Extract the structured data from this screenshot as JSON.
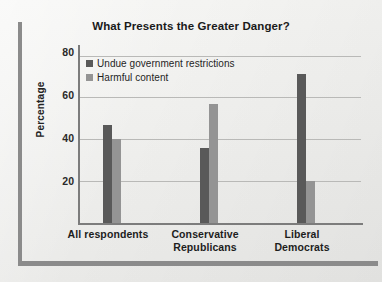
{
  "chart_data": {
    "type": "bar",
    "title": "What Presents the Greater Danger?",
    "xlabel": "",
    "ylabel": "Percentage",
    "categories": [
      "All respondents",
      "Conservative Republicans",
      "Liberal Democrats"
    ],
    "category_lines": [
      [
        "All respondents"
      ],
      [
        "Conservative",
        "Republicans"
      ],
      [
        "Liberal",
        "Democrats"
      ]
    ],
    "series": [
      {
        "name": "Undue government restrictions",
        "color": "#595959",
        "values": [
          47,
          36,
          71
        ]
      },
      {
        "name": "Harmful content",
        "color": "#949494",
        "values": [
          40,
          57,
          20
        ]
      }
    ],
    "ylim": [
      0,
      85
    ],
    "yticks": [
      20,
      40,
      60,
      80
    ],
    "ytick_labels": [
      "20",
      "40",
      "60",
      "80"
    ],
    "grid": true,
    "legend_position": "upper-left-inside"
  },
  "figure": {
    "background_color": "#f1f1ef",
    "frame_color": "#8b8b8b",
    "axis_color": "#7c7c7c",
    "gridline_color": "#b9b9b7"
  }
}
